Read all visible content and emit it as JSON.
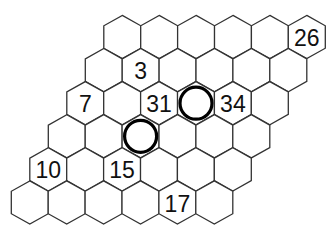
{
  "puzzle": {
    "type": "hexagonal-number-path",
    "rows": 6,
    "cols": 6,
    "grid_shape": "rhombus",
    "colors": {
      "stroke": "#333333",
      "fill": "#ffffff",
      "text": "#111111",
      "circle": "#000000"
    },
    "geometry": {
      "origin_x": 122.3,
      "origin_y": 37,
      "col_step": 36.9,
      "row_step": 33.1,
      "row_shift": -18.5,
      "half_width": 18.5,
      "vertex_offset": 21.6,
      "side_offset": 11.2,
      "circle_radius": 16
    },
    "clues": [
      {
        "row": 0,
        "col": 5,
        "value": "26"
      },
      {
        "row": 1,
        "col": 1,
        "value": "3"
      },
      {
        "row": 2,
        "col": 0,
        "value": "7"
      },
      {
        "row": 2,
        "col": 2,
        "value": "31"
      },
      {
        "row": 2,
        "col": 4,
        "value": "34"
      },
      {
        "row": 4,
        "col": 0,
        "value": "10"
      },
      {
        "row": 4,
        "col": 2,
        "value": "15"
      },
      {
        "row": 5,
        "col": 4,
        "value": "17"
      }
    ],
    "circled_cells": [
      {
        "row": 2,
        "col": 3
      },
      {
        "row": 3,
        "col": 2
      }
    ]
  }
}
